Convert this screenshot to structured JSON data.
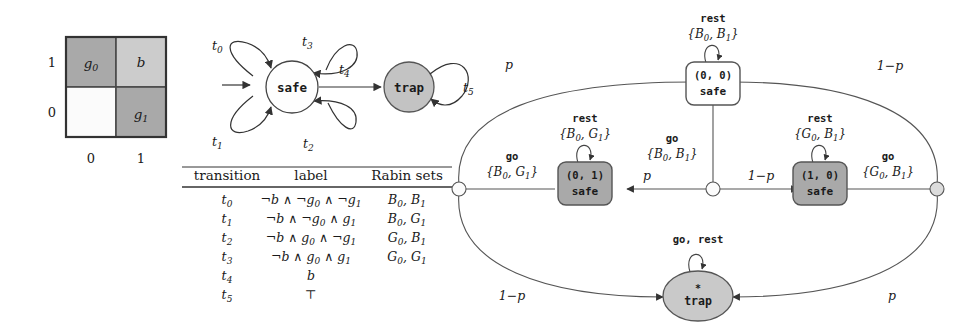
{
  "figure": {
    "grid": {
      "name": "gridworld",
      "cells": [
        {
          "label": "g0",
          "row": 1,
          "col": 0,
          "color": "#a9a9a9"
        },
        {
          "label": "b",
          "row": 1,
          "col": 1,
          "color": "#cccccc"
        },
        {
          "label": "",
          "row": 0,
          "col": 0,
          "color": "#fbfbfb"
        },
        {
          "label": "g1",
          "row": 0,
          "col": 1,
          "color": "#a9a9a9"
        }
      ],
      "row_ticks": [
        "1",
        "0"
      ],
      "col_ticks": [
        "0",
        "1"
      ],
      "border_color": "#4a4a4a"
    },
    "automaton": {
      "states": [
        {
          "id": "safe",
          "label": "safe",
          "fill": "#ffffff"
        },
        {
          "id": "trap",
          "label": "trap",
          "fill": "#c3c3c3"
        }
      ],
      "self_loop_labels": [
        "t0",
        "t3",
        "t1",
        "t2"
      ],
      "edge_label": "t4",
      "trap_loop_label": "t5"
    },
    "table": {
      "headers": [
        "transition",
        "label",
        "Rabin sets"
      ],
      "rows": [
        {
          "transition": "t0",
          "label": "¬b ∧ ¬g0 ∧ ¬g1",
          "rabin": "B0, B1"
        },
        {
          "transition": "t1",
          "label": "¬b ∧ ¬g0 ∧ g1",
          "rabin": "B0, G1"
        },
        {
          "transition": "t2",
          "label": "¬b ∧ g0 ∧ ¬g1",
          "rabin": "G0, B1"
        },
        {
          "transition": "t3",
          "label": "¬b ∧ g0 ∧ g1",
          "rabin": "G0, G1"
        },
        {
          "transition": "t4",
          "label": "b",
          "rabin": ""
        },
        {
          "transition": "t5",
          "label": "⊤",
          "rabin": ""
        }
      ]
    },
    "markov_chain": {
      "nodes": [
        {
          "id": "s00",
          "line1": "(0, 0)",
          "line2": "safe",
          "fill": "#ffffff"
        },
        {
          "id": "s01",
          "line1": "(0, 1)",
          "line2": "safe",
          "fill": "#a9a9a9"
        },
        {
          "id": "s10",
          "line1": "(1, 0)",
          "line2": "safe",
          "fill": "#a9a9a9"
        },
        {
          "id": "trap",
          "line1": "*",
          "line2": "trap",
          "fill": "#c9c9c9"
        }
      ],
      "self_loops": [
        {
          "node": "s00",
          "action": "rest",
          "sets": "{B0, B1}"
        },
        {
          "node": "s01",
          "action": "rest",
          "sets": "{B0, G1}"
        },
        {
          "node": "s10",
          "action": "rest",
          "sets": "{G0, B1}"
        },
        {
          "node": "trap",
          "action": "go, rest",
          "sets": ""
        }
      ],
      "action_labels": [
        {
          "id": "act-s00-go",
          "action": "go",
          "sets": "{B0, B1}"
        },
        {
          "id": "act-s01-go",
          "action": "go",
          "sets": "{B0, G1}"
        },
        {
          "id": "act-s10-go",
          "action": "go",
          "sets": "{G0, B1}"
        }
      ],
      "probabilities": [
        {
          "id": "p-s00-left",
          "text": "p"
        },
        {
          "id": "p-s00-right",
          "text": "1−p"
        },
        {
          "id": "p-go-left",
          "text": "p"
        },
        {
          "id": "p-go-right",
          "text": "1−p"
        },
        {
          "id": "p-trap-left",
          "text": "1−p"
        },
        {
          "id": "p-trap-right",
          "text": "p"
        }
      ]
    }
  }
}
